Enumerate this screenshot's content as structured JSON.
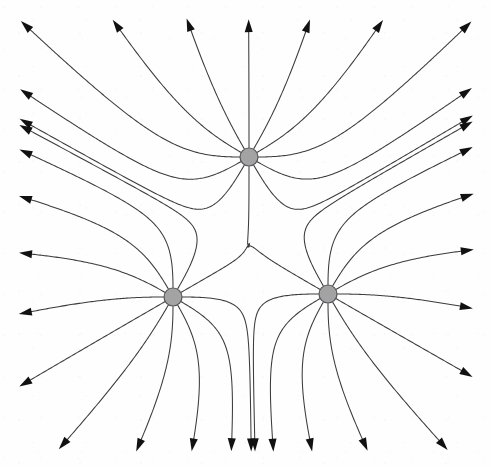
{
  "figure": {
    "title": "Electric field lines of three equal positive point charges",
    "type": "field-line-diagram",
    "caption": "",
    "background_color": "#fefefe",
    "line_color": "#3b3b3b",
    "line_width": 1.05,
    "arrow_color": "#111111",
    "charge_fill": "#a3a3a3",
    "charge_stroke": "#55555a",
    "charge_radius": 9,
    "symmetry": "C3",
    "lines_per_charge": 12,
    "charge_sign": "positive",
    "field_direction": "outward",
    "canvas": {
      "width": 491,
      "height": 467
    }
  },
  "charges": [
    {
      "id": "charge-top",
      "label": "+",
      "cx": 249,
      "cy": 157,
      "r": 9,
      "sign": "positive"
    },
    {
      "id": "charge-left",
      "label": "+",
      "cx": 173,
      "cy": 297,
      "r": 9,
      "sign": "positive"
    },
    {
      "id": "charge-right",
      "label": "+",
      "cx": 328,
      "cy": 294,
      "r": 9,
      "sign": "positive"
    }
  ],
  "arrowheads": {
    "top_group": [
      [
        150,
        52
      ],
      [
        167,
        45
      ],
      [
        189,
        38
      ],
      [
        216,
        29
      ],
      [
        280,
        29
      ],
      [
        310,
        41
      ],
      [
        331,
        47
      ],
      [
        349,
        47
      ]
    ],
    "left_group": [
      [
        32,
        302
      ],
      [
        45,
        317
      ],
      [
        54,
        339
      ],
      [
        71,
        368
      ],
      [
        117,
        412
      ],
      [
        143,
        428
      ],
      [
        163,
        437
      ],
      [
        181,
        442
      ]
    ],
    "right_group": [
      [
        463,
        252
      ],
      [
        461,
        271
      ],
      [
        457,
        293
      ],
      [
        452,
        325
      ],
      [
        424,
        383
      ],
      [
        399,
        406
      ],
      [
        383,
        420
      ],
      [
        371,
        434
      ]
    ]
  },
  "chart_data": {
    "type": "scatter",
    "title": "Electric field lines of three equal positive point charges",
    "xlabel": "",
    "ylabel": "",
    "categories": [
      "charge-top",
      "charge-left",
      "charge-right"
    ],
    "values": [
      1,
      1,
      1
    ],
    "series": [
      {
        "name": "charge x-position (px)",
        "values": [
          249,
          173,
          328
        ]
      },
      {
        "name": "charge y-position (px)",
        "values": [
          157,
          297,
          294
        ]
      },
      {
        "name": "field lines emitted",
        "values": [
          12,
          12,
          12
        ]
      },
      {
        "name": "escaping arrows",
        "values": [
          8,
          8,
          8
        ]
      }
    ],
    "xlim": [
      0,
      491
    ],
    "ylim": [
      0,
      467
    ],
    "grid": false,
    "legend": "none",
    "annotations": []
  }
}
